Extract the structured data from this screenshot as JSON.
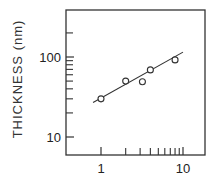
{
  "chart_data": {
    "type": "scatter",
    "title": "",
    "xlabel": "",
    "ylabel": "THICKNESS (nm)",
    "xscale": "log",
    "yscale": "log",
    "xlim": [
      0.37,
      18.5
    ],
    "ylim": [
      6,
      390
    ],
    "grid": false,
    "legend": null,
    "x_tick_labels": [
      {
        "value": 1,
        "label": "1"
      },
      {
        "value": 10,
        "label": "10"
      }
    ],
    "x_minor_ticks": [
      2,
      3,
      4,
      5,
      6,
      7,
      8,
      9
    ],
    "y_tick_labels": [
      {
        "value": 10,
        "label": "10"
      },
      {
        "value": 100,
        "label": "100"
      }
    ],
    "y_minor_ticks": [
      20,
      30,
      40,
      50,
      60,
      70,
      80,
      90,
      200
    ],
    "series": [
      {
        "name": "measured",
        "marker": "open-circle",
        "points": [
          {
            "x": 1.0,
            "y": 30
          },
          {
            "x": 2.0,
            "y": 50
          },
          {
            "x": 3.2,
            "y": 49
          },
          {
            "x": 4.0,
            "y": 69
          },
          {
            "x": 8.0,
            "y": 92
          }
        ]
      },
      {
        "name": "fit",
        "type": "line",
        "points": [
          {
            "x": 0.8,
            "y": 27
          },
          {
            "x": 10,
            "y": 115
          }
        ]
      }
    ]
  },
  "layout": {
    "frame": {
      "left": 66,
      "top": 10,
      "right": 205,
      "bottom": 155
    },
    "x_decade_px": 82,
    "x_one_px": 101,
    "y_decade_px": 80,
    "y_ten_px": 137,
    "colors": {
      "ink": "#333333",
      "background": "#ffffff"
    }
  }
}
